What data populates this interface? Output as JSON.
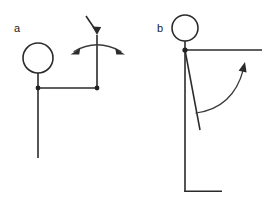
{
  "figure": {
    "background_color": "#ffffff",
    "stroke_color": "#2b2b2b",
    "width": 278,
    "height": 220,
    "panels": [
      {
        "id": "a",
        "label": "a",
        "label_x": 14,
        "label_y": 32,
        "description": "stick figure schematic with head circle, body, horizontal bar and a double-headed curved arrow over a vertical segment with a downward pointing arrow",
        "head": {
          "cx": 38,
          "cy": 58,
          "r": 15
        },
        "joints": [
          {
            "cx": 38,
            "cy": 88
          },
          {
            "cx": 97,
            "cy": 88
          }
        ],
        "segments": [
          {
            "name": "neck",
            "x1": 38,
            "y1": 73,
            "x2": 38,
            "y2": 88
          },
          {
            "name": "horizontal-bar",
            "x1": 38,
            "y1": 88,
            "x2": 97,
            "y2": 88
          },
          {
            "name": "left-leg",
            "x1": 38,
            "y1": 88,
            "x2": 38,
            "y2": 158
          },
          {
            "name": "right-upright",
            "x1": 97,
            "y1": 88,
            "x2": 97,
            "y2": 33
          },
          {
            "name": "diagonal-input",
            "x1": 86,
            "y1": 16,
            "x2": 96,
            "y2": 31
          }
        ],
        "arrows": [
          {
            "name": "down-arrow",
            "tip_x": 97,
            "tip_y": 34,
            "direction": "down"
          }
        ],
        "arcs": [
          {
            "name": "double-headed-rotation-arc",
            "path": "M 71 53 Q 97 38 124 53",
            "heads": [
              "left",
              "right"
            ]
          }
        ]
      },
      {
        "id": "b",
        "label": "b",
        "label_x": 157,
        "label_y": 32,
        "description": "stick figure schematic with head circle, horizontal arm, a vertical leg with foot and a second diagonal leg, plus a single curved arrow sweeping upward to the right",
        "head": {
          "cx": 185,
          "cy": 28,
          "r": 13
        },
        "joints": [
          {
            "cx": 185,
            "cy": 50
          }
        ],
        "segments": [
          {
            "name": "neck",
            "x1": 185,
            "y1": 41,
            "x2": 185,
            "y2": 50
          },
          {
            "name": "horizontal-arm",
            "x1": 185,
            "y1": 50,
            "x2": 262,
            "y2": 50
          },
          {
            "name": "vertical-leg",
            "x1": 185,
            "y1": 50,
            "x2": 185,
            "y2": 192
          },
          {
            "name": "foot",
            "x1": 185,
            "y1": 192,
            "x2": 222,
            "y2": 192
          },
          {
            "name": "diagonal-leg",
            "x1": 185,
            "y1": 50,
            "x2": 200,
            "y2": 130
          }
        ],
        "arcs": [
          {
            "name": "sweep-arrow",
            "path": "M 196 113 Q 232 110 244 68",
            "heads": [
              "end"
            ]
          }
        ],
        "arrows": [
          {
            "name": "sweep-arrow-head",
            "tip_x": 245,
            "tip_y": 62,
            "direction": "up-right"
          }
        ]
      }
    ]
  }
}
